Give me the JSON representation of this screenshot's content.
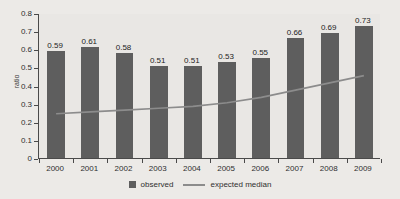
{
  "chart_data": {
    "type": "bar",
    "title": "",
    "subtitle": "",
    "xlabel": "",
    "ylabel": "ratio",
    "ylim": [
      0,
      0.8
    ],
    "ytick_labels": [
      "0.8",
      "0.7",
      "0.6",
      "0.5",
      "0.4",
      "0.3",
      "0.2",
      "0.1",
      "0"
    ],
    "ytick_values": [
      0.8,
      0.7,
      0.6,
      0.5,
      0.4,
      0.3,
      0.2,
      0.1,
      0
    ],
    "grid": false,
    "legend_position": "bottom-center",
    "categories": [
      "2000",
      "2001",
      "2002",
      "2003",
      "2004",
      "2005",
      "2006",
      "2007",
      "2008",
      "2009"
    ],
    "series": [
      {
        "name": "observed",
        "type": "bar",
        "color": "#5e5e5e",
        "values": [
          0.59,
          0.61,
          0.58,
          0.51,
          0.51,
          0.53,
          0.55,
          0.66,
          0.69,
          0.73
        ],
        "data_labels": [
          "0.59",
          "0.61",
          "0.58",
          "0.51",
          "0.51",
          "0.53",
          "0.55",
          "0.66",
          "0.69",
          "0.73"
        ]
      },
      {
        "name": "expected median",
        "type": "line",
        "color": "#8c8c8c",
        "values": [
          0.25,
          0.26,
          0.27,
          0.28,
          0.29,
          0.31,
          0.34,
          0.38,
          0.42,
          0.46
        ]
      }
    ]
  },
  "legend": {
    "items": [
      {
        "label": "observed",
        "marker": "square-swatch-icon"
      },
      {
        "label": "expected median",
        "marker": "line-swatch-icon"
      }
    ]
  }
}
